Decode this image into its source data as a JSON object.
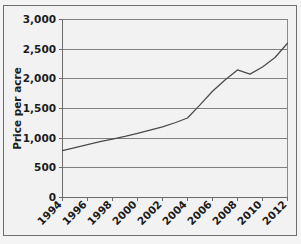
{
  "chart_data": {
    "type": "line",
    "title": "",
    "xlabel": "",
    "ylabel": "Price per acre",
    "ylim": [
      0,
      3000
    ],
    "xlim": [
      1994,
      2012
    ],
    "grid": true,
    "legend": false,
    "y_ticks": [
      0,
      500,
      1000,
      1500,
      2000,
      2500,
      3000
    ],
    "y_tick_labels": [
      "0",
      "500",
      "1,000",
      "1,500",
      "2,000",
      "2,500",
      "3,000"
    ],
    "x_ticks": [
      1994,
      1996,
      1998,
      2000,
      2002,
      2004,
      2006,
      2008,
      2010,
      2012
    ],
    "x_tick_labels": [
      "1994",
      "1996",
      "1998",
      "2000",
      "2002",
      "2004",
      "2006",
      "2008",
      "2010",
      "2012"
    ],
    "x_tick_label_rotation": 45,
    "series": [
      {
        "name": "Price per acre",
        "color": "#4a4a4a",
        "x": [
          1994,
          1995,
          1996,
          1997,
          1998,
          1999,
          2000,
          2001,
          2002,
          2003,
          2004,
          2005,
          2006,
          2007,
          2008,
          2009,
          2010,
          2011,
          2012
        ],
        "values": [
          790,
          840,
          890,
          940,
          985,
          1030,
          1080,
          1135,
          1190,
          1260,
          1340,
          1560,
          1790,
          1980,
          2150,
          2080,
          2200,
          2360,
          2600
        ]
      }
    ]
  },
  "figure": {
    "background_color": "#f2f2f2",
    "border_color": "#6e6e6e",
    "gridline_color": "#808080",
    "axis_color": "#6b6b6b"
  }
}
